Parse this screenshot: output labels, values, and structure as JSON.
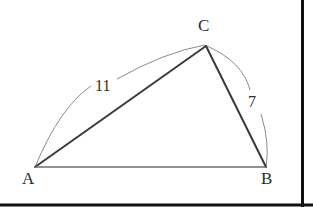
{
  "figure": {
    "kind": "triangle-with-measure-arcs",
    "background_color": "#ffffff",
    "border": {
      "right_rule_color": "#111111",
      "bottom_rule_color": "#111111"
    },
    "stroke_colors": {
      "triangle_side_strong": "#3a3a3a",
      "triangle_side_light": "#6e6e6e",
      "arc": "#8c8c8c"
    },
    "vertices": [
      {
        "id": "A",
        "label": "A",
        "x": 35,
        "y": 167
      },
      {
        "id": "B",
        "label": "B",
        "x": 266,
        "y": 167
      },
      {
        "id": "C",
        "label": "C",
        "x": 206,
        "y": 46
      }
    ],
    "sides": [
      {
        "id": "AC",
        "from": "A",
        "to": "C",
        "weight": "strong"
      },
      {
        "id": "CB",
        "from": "C",
        "to": "B",
        "weight": "strong"
      },
      {
        "id": "AB",
        "from": "A",
        "to": "B",
        "weight": "light"
      }
    ],
    "measure_arcs": [
      {
        "id": "arc-AC",
        "spans": "AC",
        "label": "11",
        "label_x": 94,
        "label_y": 78,
        "bulge": "outward-upper-left"
      },
      {
        "id": "arc-CB",
        "spans": "CB",
        "label": "7",
        "label_x": 247,
        "label_y": 94,
        "bulge": "outward-right"
      }
    ]
  },
  "labels": {
    "vertex_a": "A",
    "vertex_b": "B",
    "vertex_c": "C",
    "side_b_measure": "11",
    "side_a_measure": "7"
  }
}
